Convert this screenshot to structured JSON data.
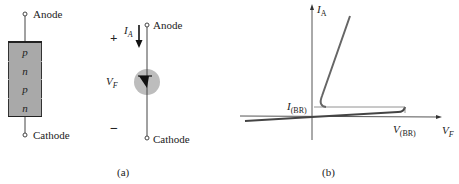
{
  "panel_a": {
    "caption": "(a)",
    "structure": {
      "layers": [
        "p",
        "n",
        "p",
        "n"
      ],
      "anode_label": "Anode",
      "cathode_label": "Cathode",
      "fill_color": "#a9a9a9"
    },
    "symbol": {
      "plus_sign": "+",
      "minus_sign": "−",
      "current_label": "I",
      "current_sub": "A",
      "voltage_label": "V",
      "voltage_sub": "F",
      "anode_label": "Anode",
      "cathode_label": "Cathode"
    }
  },
  "panel_b": {
    "caption": "(b)",
    "y_axis_label": "I",
    "y_axis_sub": "A",
    "x_axis_label": "V",
    "x_axis_sub": "F",
    "breakover_current_label": "I",
    "breakover_current_sub": "(BR)",
    "breakover_voltage_label": "V",
    "breakover_voltage_sub": "(BR)"
  }
}
